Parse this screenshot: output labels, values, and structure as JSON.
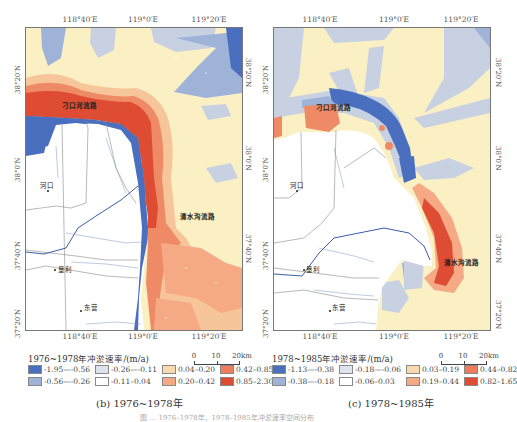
{
  "figure": {
    "bottom_caption_partial": "图 … 1976–1978年、1978–1985年冲淤速率空间分布"
  },
  "panels": [
    {
      "id": "b",
      "caption": "(b) 1976~1978年",
      "legend_title": "1976~1978年冲淤速率/(m/a)",
      "axes": {
        "top_ticks": [
          "118°40′E",
          "119°0′E",
          "119°20′E"
        ],
        "bottom_ticks": [
          "118°40′E",
          "119°0′E",
          "119°20′E"
        ],
        "left_ticks": [
          "38°20′N",
          "38°0′N",
          "37°40′N",
          "37°20′N"
        ],
        "right_ticks": [
          "38°20′N",
          "38°0′N",
          "37°40′N",
          "37°20′N"
        ]
      },
      "places": {
        "diaokou": "刁口河流路",
        "qingshuigou": "清水沟流路",
        "hekou": "河口",
        "kenli": "垦利",
        "dongying": "东营"
      },
      "scale": {
        "labels": [
          "0",
          "10",
          "20km"
        ]
      },
      "legend": [
        {
          "range": "-1.95—-0.56",
          "color": "#4a6fbf"
        },
        {
          "range": "-0.26—-0.11",
          "color": "#dde4ee"
        },
        {
          "range": "0.04–0.20",
          "color": "#f9d9b0"
        },
        {
          "range": "0.42–0.85",
          "color": "#ef7d5c"
        },
        {
          "range": "-0.56—-0.26",
          "color": "#9fb3d9"
        },
        {
          "range": "-0.11–0.04",
          "color": "#ffffff"
        },
        {
          "range": "0.20–0.42",
          "color": "#f5a984"
        },
        {
          "range": "0.85–2.30",
          "color": "#de4c33"
        }
      ]
    },
    {
      "id": "c",
      "caption": "(c) 1978~1985年",
      "legend_title": "1978~1985年冲淤速率/(m/a)",
      "axes": {
        "top_ticks": [
          "118°40′E",
          "119°0′E",
          "119°20′E"
        ],
        "bottom_ticks": [
          "118°40′E",
          "119°0′E",
          "119°20′E"
        ],
        "left_ticks": [
          "38°20′N",
          "38°0′N",
          "37°40′N",
          "37°20′N"
        ],
        "right_ticks": [
          "38°20′N",
          "38°0′N",
          "37°40′N",
          "37°20′N"
        ]
      },
      "places": {
        "diaokou": "刁口河流路",
        "qingshuigou": "清水沟流路",
        "hekou": "河口",
        "kenli": "垦利",
        "dongying": "东营"
      },
      "scale": {
        "labels": [
          "0",
          "10",
          "20km"
        ]
      },
      "legend": [
        {
          "range": "-1.13—-0.38",
          "color": "#4a6fbf"
        },
        {
          "range": "-0.18—-0.06",
          "color": "#dde4ee"
        },
        {
          "range": "0.03–0.19",
          "color": "#f9d9b0"
        },
        {
          "range": "0.44–0.82",
          "color": "#ef7d5c"
        },
        {
          "range": "-0.38—-0.18",
          "color": "#9fb3d9"
        },
        {
          "range": "-0.06–0.03",
          "color": "#ffffff"
        },
        {
          "range": "0.19–0.44",
          "color": "#f5a984"
        },
        {
          "range": "0.82–1.65",
          "color": "#de4c33"
        }
      ]
    }
  ],
  "colors": {
    "sea_base": "#fbf0c4",
    "deep_blue": "#4a6fbf",
    "mid_blue": "#9fb3d9",
    "light_blue": "#c7d1e2",
    "pale_yellow": "#fbf0c4",
    "light_orange": "#f7c59a",
    "orange": "#ef8a66",
    "red": "#de4c33",
    "river": "#3b5ea8",
    "boundary": "#8a8a8a"
  }
}
